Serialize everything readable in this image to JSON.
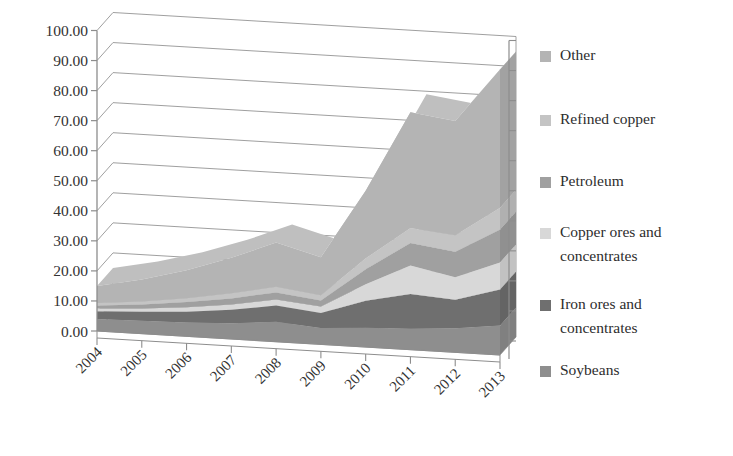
{
  "chart_data": {
    "type": "area",
    "stacked": true,
    "projection": "3d",
    "title": "",
    "subtitle": "",
    "xlabel": "",
    "ylabel": "",
    "categories": [
      "2004",
      "2005",
      "2006",
      "2007",
      "2008",
      "2009",
      "2010",
      "2011",
      "2012",
      "2013"
    ],
    "ylim": [
      0,
      100
    ],
    "ytick_step": 10,
    "ytick_labels": [
      "0.00",
      "10.00",
      "20.00",
      "30.00",
      "40.00",
      "50.00",
      "60.00",
      "70.00",
      "80.00",
      "90.00",
      "100.00"
    ],
    "grid": true,
    "grid_axis": "y",
    "legend_position": "right",
    "series": [
      {
        "name": "Soybeans",
        "color": "#8e8e8e",
        "values": [
          4.0,
          4.3,
          4.6,
          5.2,
          6.6,
          5.4,
          6.4,
          7.0,
          8.0,
          9.8
        ]
      },
      {
        "name": "Iron ores and concentrates",
        "color": "#6f6f6f",
        "values": [
          2.6,
          3.0,
          3.6,
          4.5,
          5.4,
          5.0,
          9.0,
          11.5,
          9.5,
          12.0
        ]
      },
      {
        "name": "Copper ores and concentrates",
        "color": "#d8d8d8",
        "values": [
          0.9,
          1.1,
          1.5,
          1.8,
          2.0,
          2.2,
          5.5,
          9.5,
          7.5,
          9.0
        ]
      },
      {
        "name": "Petroleum",
        "color": "#a0a0a0",
        "values": [
          1.0,
          1.3,
          1.7,
          2.0,
          2.4,
          2.0,
          5.0,
          7.5,
          8.5,
          11.0
        ]
      },
      {
        "name": "Refined copper",
        "color": "#c4c4c4",
        "values": [
          0.8,
          1.0,
          1.3,
          1.7,
          1.9,
          1.7,
          3.6,
          5.0,
          5.5,
          7.2
        ]
      },
      {
        "name": "Other",
        "color": "#b4b4b4",
        "values": [
          5.7,
          7.3,
          9.3,
          11.8,
          14.7,
          12.7,
          22.5,
          38.5,
          38.0,
          46.0
        ]
      }
    ],
    "stack_totals": [
      15.0,
      18.0,
      22.0,
      27.0,
      33.0,
      29.0,
      52.0,
      79.0,
      77.0,
      95.0
    ]
  },
  "legend": {
    "items": [
      {
        "label": "Other",
        "color": "#b4b4b4"
      },
      {
        "label": "Refined copper",
        "color": "#c4c4c4"
      },
      {
        "label": "Petroleum",
        "color": "#a0a0a0"
      },
      {
        "label": "Copper ores and",
        "label2": "concentrates",
        "color": "#d8d8d8"
      },
      {
        "label": "Iron ores and",
        "label2": "concentrates",
        "color": "#6f6f6f"
      },
      {
        "label": "Soybeans",
        "color": "#8e8e8e"
      }
    ]
  },
  "axes": {
    "wall_color": "#9a9a9a",
    "floor_color": "#fbfbfb",
    "tick_color": "#8d8d8d"
  }
}
